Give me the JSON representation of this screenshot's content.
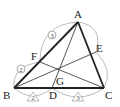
{
  "diagram": {
    "type": "triangle-cevians",
    "points": {
      "A": {
        "label": "A",
        "x": 78,
        "y": 22
      },
      "B": {
        "label": "B",
        "x": 14,
        "y": 88
      },
      "C": {
        "label": "C",
        "x": 104,
        "y": 88
      },
      "D": {
        "label": "D",
        "x": 52,
        "y": 88
      },
      "E": {
        "label": "E",
        "x": 96,
        "y": 52
      },
      "F": {
        "label": "F",
        "x": 40,
        "y": 62
      },
      "G": {
        "label": "G",
        "x": 59,
        "y": 73
      }
    },
    "ratio_marks": {
      "BF": "2",
      "FA": "3",
      "BD": "2",
      "DC": "3"
    },
    "colors": {
      "bold_line": "#222222",
      "thin_line": "#444444",
      "arc": "#aaaaaa"
    }
  }
}
